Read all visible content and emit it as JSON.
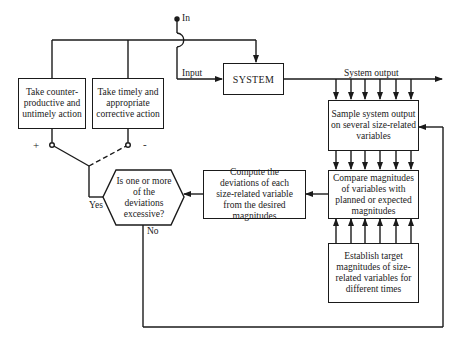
{
  "diagram": {
    "type": "flowchart",
    "terminals": {
      "in_label": "In",
      "input_label": "Input",
      "system_output_label": "System output"
    },
    "nodes": {
      "system": {
        "label": "SYSTEM"
      },
      "sample": {
        "label": "Sample system output on several size-related variables"
      },
      "compare": {
        "label": "Compare magnitudes of variables with planned or expected magnitudes"
      },
      "establish": {
        "label": "Establish target magnitudes of size-related variables for different times"
      },
      "compute": {
        "label": "Compute the deviations of each size-related variable from the desired magnitudes"
      },
      "decision": {
        "label": "Is one or more of the deviations excessive?"
      },
      "counterproductive": {
        "label": "Take counter-productive and untimely action"
      },
      "corrective": {
        "label": "Take timely and appropriate corrective action"
      }
    },
    "branch_labels": {
      "yes": "Yes",
      "no": "No",
      "plus": "+",
      "minus": "-"
    },
    "edges": [
      {
        "from": "in",
        "to": "system",
        "label": "Input"
      },
      {
        "from": "counterproductive",
        "to": "system"
      },
      {
        "from": "corrective",
        "to": "system"
      },
      {
        "from": "system",
        "to": "output",
        "label": "System output"
      },
      {
        "from": "system-output",
        "to": "sample",
        "count": 6
      },
      {
        "from": "sample",
        "to": "compare",
        "count": 6
      },
      {
        "from": "establish",
        "to": "compare",
        "count": 6
      },
      {
        "from": "compare",
        "to": "compute"
      },
      {
        "from": "compute",
        "to": "decision"
      },
      {
        "from": "decision",
        "to": "switch",
        "label": "Yes"
      },
      {
        "from": "decision",
        "to": "sample",
        "label": "No"
      }
    ]
  }
}
